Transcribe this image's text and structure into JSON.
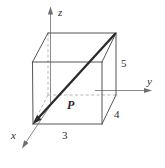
{
  "figure": {
    "kind": "3d-vector-box-diagram",
    "background_color": "#ffffff",
    "ink_color": "#2e2e2e",
    "axis_color": "#8a8a8a",
    "hidden_edge_color": "#b6b6b6",
    "vector_color": "#2b2b2b"
  },
  "axes": [
    {
      "name": "z-axis",
      "label": "z",
      "direction": "up"
    },
    {
      "name": "y-axis",
      "label": "y",
      "direction": "right"
    },
    {
      "name": "x-axis",
      "label": "x",
      "direction": "down-left"
    }
  ],
  "vector": {
    "label": "P",
    "from": "origin",
    "to": "far-top-back-right-corner"
  },
  "dimensions": [
    {
      "name": "front-bottom-edge",
      "label": "3",
      "along_axis": "y"
    },
    {
      "name": "depth-edge",
      "label": "4",
      "along_axis": "x"
    },
    {
      "name": "vertical-edge",
      "label": "5",
      "along_axis": "z"
    }
  ],
  "labels": {
    "z": "z",
    "y": "y",
    "x": "x",
    "vector_p": "P",
    "dim_3": "3",
    "dim_4": "4",
    "dim_5": "5"
  }
}
